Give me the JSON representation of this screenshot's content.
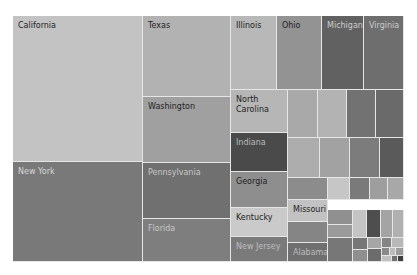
{
  "chart_data": {
    "type": "treemap",
    "title": "",
    "legend": "none",
    "color_scale": "grayscale (sequential, lighter to darker)",
    "plot_bounds": {
      "left": 13,
      "top": 16,
      "right": 404,
      "bottom": 262
    },
    "cells": [
      {
        "label": "California",
        "x": 13,
        "y": 16,
        "w": 130,
        "h": 146,
        "color": "#c3c3c3",
        "text_color": "#222222"
      },
      {
        "label": "New York",
        "x": 13,
        "y": 162,
        "w": 130,
        "h": 100,
        "color": "#797979",
        "text_color": "#d8d8d8"
      },
      {
        "label": "Texas",
        "x": 143,
        "y": 16,
        "w": 88,
        "h": 81,
        "color": "#b2b2b2",
        "text_color": "#222222"
      },
      {
        "label": "Washington",
        "x": 143,
        "y": 97,
        "w": 88,
        "h": 66,
        "color": "#a0a0a0",
        "text_color": "#222222"
      },
      {
        "label": "Pennsylvania",
        "x": 143,
        "y": 163,
        "w": 88,
        "h": 56,
        "color": "#707070",
        "text_color": "#c8c8c8"
      },
      {
        "label": "Florida",
        "x": 143,
        "y": 219,
        "w": 88,
        "h": 43,
        "color": "#7e7e7e",
        "text_color": "#c8c8c8"
      },
      {
        "label": "Illinois",
        "x": 231,
        "y": 16,
        "w": 46,
        "h": 74,
        "color": "#b8b8b8",
        "text_color": "#222222"
      },
      {
        "label": "Ohio",
        "x": 277,
        "y": 16,
        "w": 45,
        "h": 74,
        "color": "#939393",
        "text_color": "#222222"
      },
      {
        "label": "Michigan",
        "x": 322,
        "y": 16,
        "w": 42,
        "h": 74,
        "color": "#616161",
        "text_color": "#cccccc"
      },
      {
        "label": "Virginia",
        "x": 364,
        "y": 16,
        "w": 40,
        "h": 74,
        "color": "#6e6e6e",
        "text_color": "#cccccc"
      },
      {
        "label": "North\nCarolina",
        "x": 231,
        "y": 90,
        "w": 57,
        "h": 43,
        "color": "#b6b6b6",
        "text_color": "#222222"
      },
      {
        "label": "Indiana",
        "x": 231,
        "y": 133,
        "w": 57,
        "h": 39,
        "color": "#4a4a4a",
        "text_color": "#bcbcbc"
      },
      {
        "label": "Georgia",
        "x": 231,
        "y": 172,
        "w": 57,
        "h": 36,
        "color": "#8e8e8e",
        "text_color": "#222222"
      },
      {
        "label": "Kentucky",
        "x": 231,
        "y": 208,
        "w": 57,
        "h": 29,
        "color": "#cacaca",
        "text_color": "#222222"
      },
      {
        "label": "New Jersey",
        "x": 231,
        "y": 237,
        "w": 57,
        "h": 25,
        "color": "#7a7a7a",
        "text_color": "#bdbdbd"
      },
      {
        "label": "",
        "x": 288,
        "y": 90,
        "w": 30,
        "h": 48,
        "color": "#a9a9a9"
      },
      {
        "label": "",
        "x": 318,
        "y": 90,
        "w": 29,
        "h": 48,
        "color": "#b3b3b3"
      },
      {
        "label": "",
        "x": 347,
        "y": 90,
        "w": 29,
        "h": 48,
        "color": "#727272"
      },
      {
        "label": "",
        "x": 376,
        "y": 90,
        "w": 28,
        "h": 48,
        "color": "#6a6a6a"
      },
      {
        "label": "",
        "x": 288,
        "y": 138,
        "w": 32,
        "h": 40,
        "color": "#adadad"
      },
      {
        "label": "",
        "x": 320,
        "y": 138,
        "w": 30,
        "h": 40,
        "color": "#a2a2a2"
      },
      {
        "label": "",
        "x": 350,
        "y": 138,
        "w": 30,
        "h": 40,
        "color": "#7c7c7c"
      },
      {
        "label": "",
        "x": 380,
        "y": 138,
        "w": 24,
        "h": 40,
        "color": "#5a5a5a"
      },
      {
        "label": "",
        "x": 288,
        "y": 178,
        "w": 40,
        "h": 22,
        "color": "#8c8c8c"
      },
      {
        "label": "",
        "x": 328,
        "y": 178,
        "w": 22,
        "h": 22,
        "color": "#c6c6c6"
      },
      {
        "label": "",
        "x": 350,
        "y": 178,
        "w": 20,
        "h": 22,
        "color": "#7a7a7a"
      },
      {
        "label": "",
        "x": 370,
        "y": 178,
        "w": 18,
        "h": 22,
        "color": "#9e9e9e"
      },
      {
        "label": "",
        "x": 388,
        "y": 178,
        "w": 16,
        "h": 22,
        "color": "#a8a8a8"
      },
      {
        "label": "Missouri",
        "x": 288,
        "y": 200,
        "w": 40,
        "h": 22,
        "color": "#c2c2c2",
        "text_color": "#222222"
      },
      {
        "label": "",
        "x": 288,
        "y": 222,
        "w": 40,
        "h": 21,
        "color": "#858585"
      },
      {
        "label": "Alabama",
        "x": 288,
        "y": 243,
        "w": 40,
        "h": 19,
        "color": "#6f6f6f",
        "text_color": "#bdbdbd"
      },
      {
        "label": "",
        "x": 328,
        "y": 210,
        "w": 25,
        "h": 15,
        "color": "#909090"
      },
      {
        "label": "",
        "x": 328,
        "y": 225,
        "w": 25,
        "h": 13,
        "color": "#9a9a9a"
      },
      {
        "label": "",
        "x": 328,
        "y": 238,
        "w": 25,
        "h": 24,
        "color": "#777777"
      },
      {
        "label": "",
        "x": 353,
        "y": 210,
        "w": 14,
        "h": 28,
        "color": "#c4c4c4"
      },
      {
        "label": "",
        "x": 367,
        "y": 210,
        "w": 14,
        "h": 28,
        "color": "#4e4e4e"
      },
      {
        "label": "",
        "x": 381,
        "y": 210,
        "w": 12,
        "h": 28,
        "color": "#a4a4a4"
      },
      {
        "label": "",
        "x": 393,
        "y": 210,
        "w": 11,
        "h": 28,
        "color": "#b0b0b0"
      },
      {
        "label": "",
        "x": 353,
        "y": 238,
        "w": 15,
        "h": 12,
        "color": "#767676"
      },
      {
        "label": "",
        "x": 353,
        "y": 250,
        "w": 15,
        "h": 12,
        "color": "#8f8f8f"
      },
      {
        "label": "",
        "x": 368,
        "y": 238,
        "w": 14,
        "h": 11,
        "color": "#a6a6a6"
      },
      {
        "label": "",
        "x": 368,
        "y": 249,
        "w": 14,
        "h": 13,
        "color": "#6c6c6c"
      },
      {
        "label": "",
        "x": 382,
        "y": 238,
        "w": 10,
        "h": 10,
        "color": "#858585"
      },
      {
        "label": "",
        "x": 392,
        "y": 238,
        "w": 12,
        "h": 10,
        "color": "#b8b8b8"
      },
      {
        "label": "",
        "x": 382,
        "y": 248,
        "w": 8,
        "h": 8,
        "color": "#8a8a8a"
      },
      {
        "label": "",
        "x": 390,
        "y": 248,
        "w": 6,
        "h": 8,
        "color": "#bcbcbc"
      },
      {
        "label": "",
        "x": 396,
        "y": 248,
        "w": 8,
        "h": 8,
        "color": "#9c9c9c"
      },
      {
        "label": "",
        "x": 382,
        "y": 256,
        "w": 10,
        "h": 6,
        "color": "#c0c0c0"
      },
      {
        "label": "",
        "x": 392,
        "y": 256,
        "w": 6,
        "h": 6,
        "color": "#707070"
      },
      {
        "label": "",
        "x": 398,
        "y": 256,
        "w": 6,
        "h": 6,
        "color": "#3e3e3e"
      }
    ]
  }
}
